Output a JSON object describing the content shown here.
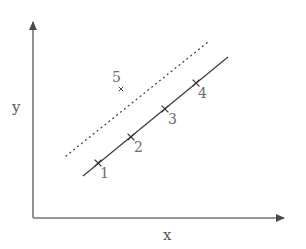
{
  "figure": {
    "background_color": "#ffffff",
    "line_color": "#3a3a3c",
    "axis_color": "#6b6b6d",
    "label_color": "#58585a"
  },
  "axes": {
    "x_label": "x",
    "y_label": "y",
    "origin": {
      "x": 33,
      "y": 218
    },
    "x_axis_end": {
      "x": 292,
      "y": 218
    },
    "y_axis_end": {
      "x": 33,
      "y": 15
    },
    "x_label_pos": {
      "x": 163,
      "y": 228
    },
    "y_label_pos": {
      "x": 12,
      "y": 100
    }
  },
  "chart_data": {
    "type": "scatter",
    "title": "",
    "xlabel": "x",
    "ylabel": "y",
    "grid": false,
    "legend": "none",
    "axis_style": "arrow-axes-unlabeled-ticks",
    "points": [
      {
        "label": "1",
        "px": 98,
        "py": 163,
        "label_px": 100,
        "label_py": 166,
        "marker": "x",
        "on_line": "solid-regression-line"
      },
      {
        "label": "2",
        "px": 131,
        "py": 137,
        "label_px": 134,
        "label_py": 140,
        "marker": "x",
        "on_line": "solid-regression-line"
      },
      {
        "label": "3",
        "px": 165,
        "py": 109,
        "label_px": 168,
        "label_py": 112,
        "marker": "x",
        "on_line": "solid-regression-line"
      },
      {
        "label": "4",
        "px": 196,
        "py": 83,
        "label_px": 198,
        "label_py": 86,
        "marker": "x",
        "on_line": "solid-regression-line"
      },
      {
        "label": "5",
        "px": 121,
        "py": 89,
        "label_px": 112,
        "label_py": 70,
        "marker": "x",
        "on_line": "none"
      }
    ],
    "lines": [
      {
        "name": "solid-regression-line",
        "style": "solid",
        "x1": 83,
        "y1": 176,
        "x2": 228,
        "y2": 57,
        "description": "solid line through points 1, 2, 3 and 4"
      },
      {
        "name": "dotted-parallel-line",
        "style": "dotted",
        "x1": 66,
        "y1": 156,
        "x2": 208,
        "y2": 42,
        "description": "dotted line parallel to and above the solid line, passing near point 5"
      }
    ]
  }
}
